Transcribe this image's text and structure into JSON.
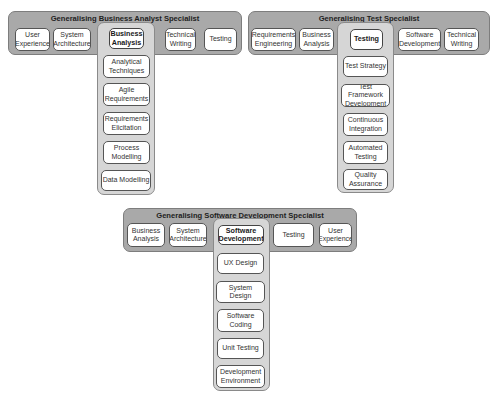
{
  "panels": [
    {
      "title": "Generalising Business Analyst Specialist",
      "row": [
        {
          "label": "User\nExperience"
        },
        {
          "label": "System\nArchitecture"
        },
        {
          "label": "Business\nAnalysis",
          "selected": true
        },
        {
          "label": "Technical\nWriting"
        },
        {
          "label": "Testing"
        }
      ],
      "column": [
        {
          "label": "Analytical\nTechniques"
        },
        {
          "label": "Agile\nRequirements"
        },
        {
          "label": "Requirements\nElicitation"
        },
        {
          "label": "Process\nModelling"
        },
        {
          "label": "Data Modelling"
        }
      ]
    },
    {
      "title": "Generalising Test Specialist",
      "row": [
        {
          "label": "Requirements\nEngineering"
        },
        {
          "label": "Business\nAnalysis"
        },
        {
          "label": "Testing",
          "selected": true
        },
        {
          "label": "Software\nDevelopment"
        },
        {
          "label": "Technical\nWriting"
        }
      ],
      "column": [
        {
          "label": "Test Strategy"
        },
        {
          "label": "Test Framework\nDevelopment"
        },
        {
          "label": "Continuous\nIntegration"
        },
        {
          "label": "Automated\nTesting"
        },
        {
          "label": "Quality\nAssurance"
        }
      ]
    },
    {
      "title": "Generalising Software Development Specialist",
      "row": [
        {
          "label": "Business\nAnalysis"
        },
        {
          "label": "System\nArchitecture"
        },
        {
          "label": "Software\nDevelopment",
          "selected": true
        },
        {
          "label": "Testing"
        },
        {
          "label": "User\nExperience"
        }
      ],
      "column": [
        {
          "label": "UX Design"
        },
        {
          "label": "System Design"
        },
        {
          "label": "Software\nCoding"
        },
        {
          "label": "Unit Testing"
        },
        {
          "label": "Development\nEnvironment"
        }
      ]
    }
  ]
}
